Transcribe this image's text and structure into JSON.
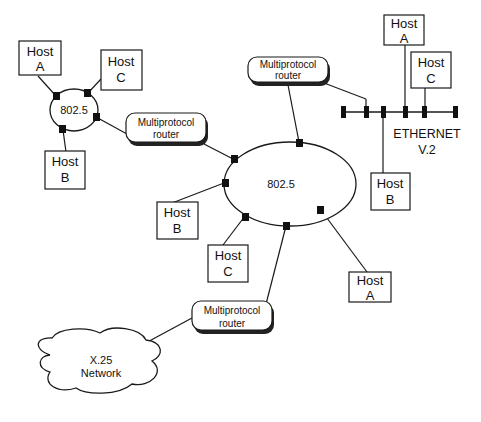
{
  "diagram": {
    "type": "network-topology",
    "colors": {
      "line": "#1a1a1a",
      "fill": "#ffffff",
      "node": "#111111",
      "shadow": "#222222"
    },
    "ring_left": {
      "label": "802.5",
      "hosts": [
        {
          "line1": "Host",
          "line2": "A"
        },
        {
          "line1": "Host",
          "line2": "C"
        },
        {
          "line1": "Host",
          "line2": "B"
        }
      ]
    },
    "ring_center": {
      "label": "802.5",
      "hosts": [
        {
          "line1": "Host",
          "line2": "B"
        },
        {
          "line1": "Host",
          "line2": "C"
        },
        {
          "line1": "Host",
          "line2": "A"
        }
      ]
    },
    "ethernet": {
      "line1": "ETHERNET",
      "line2": "V.2",
      "hosts": [
        {
          "line1": "Host",
          "line2": "A"
        },
        {
          "line1": "Host",
          "line2": "C"
        },
        {
          "line1": "Host",
          "line2": "B"
        }
      ]
    },
    "routers": [
      {
        "line1": "Multiprotocol",
        "line2": "router"
      },
      {
        "line1": "Multiprotocol",
        "line2": "router"
      },
      {
        "line1": "Multiprotocol",
        "line2": "router"
      }
    ],
    "cloud": {
      "line1": "X.25",
      "line2": "Network"
    }
  }
}
